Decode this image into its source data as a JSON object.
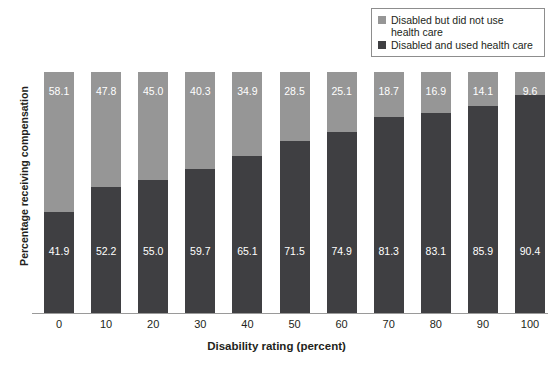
{
  "chart_data": {
    "type": "bar",
    "subtype": "stacked-100-percent",
    "title": "",
    "xlabel": "Disability rating (percent)",
    "ylabel": "Percentage receiving compensation",
    "categories": [
      "0",
      "10",
      "20",
      "30",
      "40",
      "50",
      "60",
      "70",
      "80",
      "90",
      "100"
    ],
    "series": [
      {
        "name": "Disabled but did not use\nhealth care",
        "color": "#969696",
        "values": [
          58.1,
          47.8,
          45.0,
          40.3,
          34.9,
          28.5,
          25.1,
          18.7,
          16.9,
          14.1,
          9.6
        ]
      },
      {
        "name": "Disabled and used health care",
        "color": "#3f3f42",
        "values": [
          41.9,
          52.2,
          55.0,
          59.7,
          65.1,
          71.5,
          74.9,
          81.3,
          83.1,
          85.9,
          90.4
        ]
      }
    ],
    "ylim": [
      0,
      100
    ],
    "grid": false,
    "legend_position": "top-right",
    "axis_color": "#9a9a9a"
  },
  "legend": {
    "items": [
      {
        "label": "Disabled but did not use\nhealth care",
        "color": "#969696"
      },
      {
        "label": "Disabled and used health care",
        "color": "#3f3f42"
      }
    ]
  }
}
